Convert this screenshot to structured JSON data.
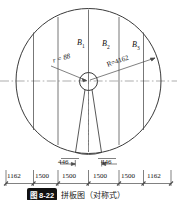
{
  "drawing": {
    "title_caption": "拼板图（对称式）",
    "figure_number": "图 8-22",
    "panels": [
      {
        "label": "B",
        "sub": "1"
      },
      {
        "label": "B",
        "sub": "2"
      },
      {
        "label": "B",
        "sub": "3"
      }
    ],
    "radii": {
      "inner_label": "r = 88",
      "outer_label": "R=4162"
    },
    "dimension_chain": [
      "1162",
      "1500",
      "1500",
      "1500",
      "1500",
      "1162"
    ],
    "wedge_dimensions": [
      "446",
      "446"
    ],
    "colors": {
      "line": "#4a4a4a",
      "outline": "#3a3a3a",
      "centerline": "#8a8a8a",
      "text": "#111111",
      "badge_bg": "#111111"
    }
  }
}
